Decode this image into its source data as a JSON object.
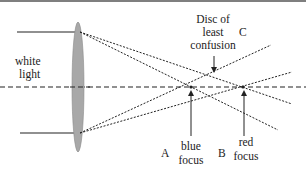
{
  "diagram": {
    "colors": {
      "line": "#222222",
      "lens_fill": "#a8a8a8",
      "lens_stroke": "#8a8a8a",
      "top_border": "#555555",
      "background": "#ffffff"
    },
    "labels": {
      "white_light_1": "white",
      "white_light_2": "light",
      "disc_1": "Disc of",
      "disc_2": "least",
      "disc_3": "confusion",
      "point_c": "C",
      "point_a": "A",
      "point_b": "B",
      "blue_1": "blue",
      "blue_2": "focus",
      "red_1": "red",
      "red_2": "focus"
    },
    "elements": [
      "converging lens",
      "incoming white light rays (top and bottom)",
      "optical axis (dashed)",
      "refracted blue rays converging at blue focus",
      "refracted red rays converging at red focus",
      "disc of least confusion marker arrow",
      "blue focus arrow",
      "red focus arrow"
    ]
  }
}
